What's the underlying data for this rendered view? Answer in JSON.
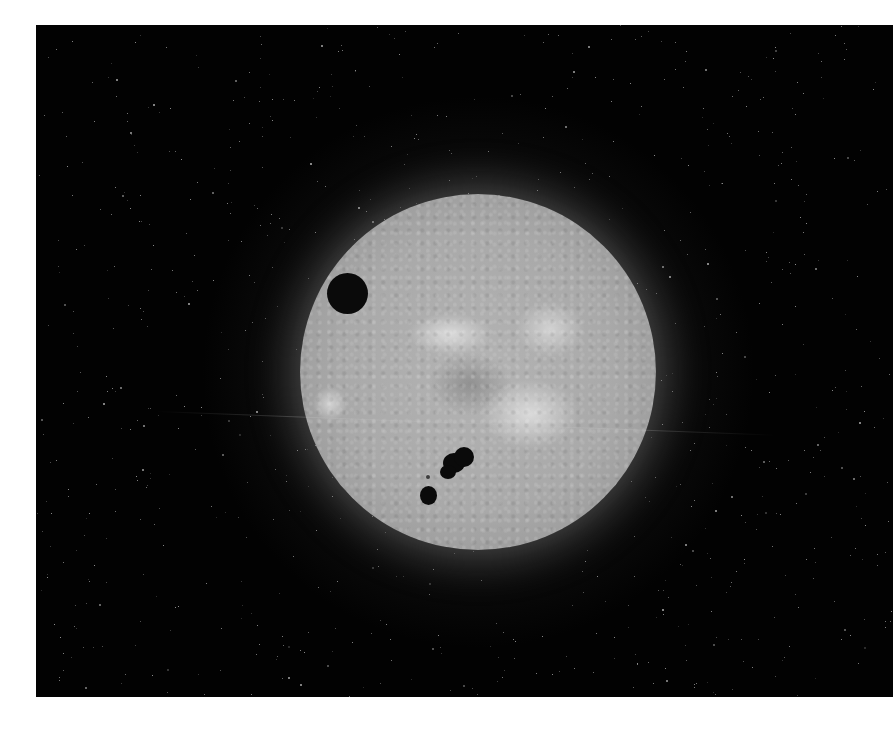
{
  "scene": {
    "subject": "sun-disc-with-planetary-transit",
    "colors": {
      "background": "#020202",
      "margin": "#ffffff",
      "sun_surface": "#acacac",
      "transit_body": "#0a0a0a",
      "sunspots": "#0a0a0a"
    },
    "features": {
      "transit_body": {
        "label": "transiting-planet"
      },
      "sunspots": [
        {
          "label": "sunspot-large"
        },
        {
          "label": "sunspot-small"
        },
        {
          "label": "sunspot-tiny"
        }
      ]
    }
  }
}
